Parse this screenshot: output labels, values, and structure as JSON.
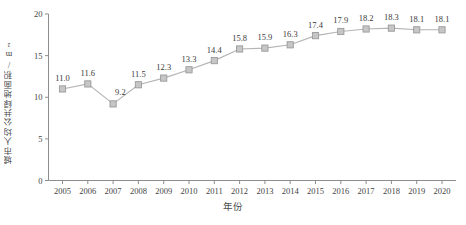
{
  "chart_data": {
    "type": "line",
    "title": "",
    "xlabel": "年份",
    "ylabel": "城市人均公共绿地面积/m²",
    "categories": [
      "2005",
      "2006",
      "2007",
      "2008",
      "2009",
      "2010",
      "2011",
      "2012",
      "2013",
      "2014",
      "2015",
      "2016",
      "2017",
      "2018",
      "2019",
      "2020"
    ],
    "values": [
      11.0,
      11.6,
      9.2,
      11.5,
      12.3,
      13.3,
      14.4,
      15.8,
      15.9,
      16.3,
      17.4,
      17.9,
      18.2,
      18.3,
      18.1,
      18.1
    ],
    "value_labels": [
      "11.0",
      "11.6",
      "9.2",
      "11.5",
      "12.3",
      "13.3",
      "14.4",
      "15.8",
      "15.9",
      "16.3",
      "17.4",
      "17.9",
      "18.2",
      "18.3",
      "18.1",
      "18.1"
    ],
    "ylim": [
      0,
      20
    ],
    "yticks": [
      0,
      5,
      10,
      15,
      20
    ],
    "ytick_labels": [
      "0",
      "5",
      "10",
      "15",
      "20"
    ],
    "grid": false,
    "legend": null,
    "legend_position": "none",
    "marker": "square",
    "series_color": "#b4b4b4",
    "marker_fill": "#c6c6c6",
    "marker_stroke": "#9a9a9a",
    "axis_color": "#8d8d8d"
  }
}
